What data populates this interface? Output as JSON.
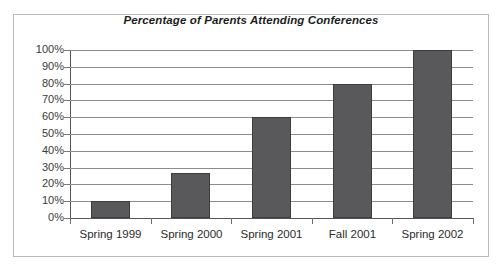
{
  "chart_data": {
    "type": "bar",
    "title": "Percentage of Parents Attending Conferences",
    "xlabel": "",
    "ylabel": "",
    "categories": [
      "Spring 1999",
      "Spring 2000",
      "Spring 2001",
      "Fall 2001",
      "Spring 2002"
    ],
    "values": [
      10,
      27,
      60,
      80,
      100
    ],
    "ylim": [
      0,
      100
    ],
    "ytick_labels": [
      "0%",
      "10%",
      "20%",
      "30%",
      "40%",
      "50%",
      "60%",
      "70%",
      "80%",
      "90%",
      "100%"
    ],
    "ytick_values": [
      0,
      10,
      20,
      30,
      40,
      50,
      60,
      70,
      80,
      90,
      100
    ],
    "grid": true,
    "legend": false,
    "legend_position": "none",
    "bar_color": "#59595b",
    "bar_edge_color": "#3d3d3f",
    "gridline_color": "#8c8c8c",
    "axis_color": "#555555",
    "frame_color": "#b9b9b9",
    "background_color": "#ffffff"
  }
}
